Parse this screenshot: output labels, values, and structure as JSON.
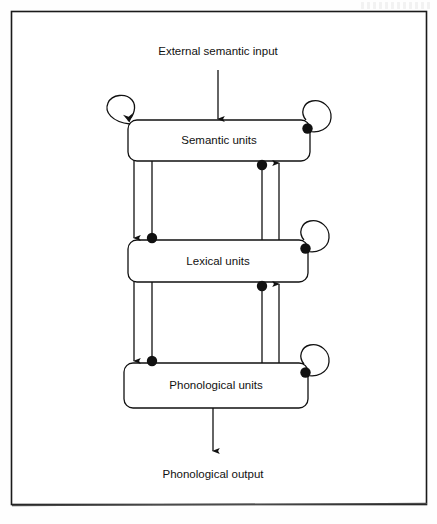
{
  "figure": {
    "frame": {
      "border_color": "#1a1a1a"
    },
    "input_label": "External semantic input",
    "output_label": "Phonological output",
    "layers": [
      {
        "id": "semantic",
        "label": "Semantic units"
      },
      {
        "id": "lexical",
        "label": "Lexical units"
      },
      {
        "id": "phonological",
        "label": "Phonological units"
      }
    ],
    "self_connections": [
      {
        "layer": "semantic",
        "side": "left",
        "type": "excitatory",
        "terminal": "arrow"
      },
      {
        "layer": "semantic",
        "side": "right",
        "type": "inhibitory",
        "terminal": "dot"
      },
      {
        "layer": "lexical",
        "side": "right",
        "type": "inhibitory",
        "terminal": "dot"
      },
      {
        "layer": "phonological",
        "side": "right",
        "type": "inhibitory",
        "terminal": "dot"
      }
    ],
    "inter_layer_connections": [
      {
        "from": "semantic",
        "to": "lexical",
        "direction": "down",
        "column": "left-outer",
        "type": "excitatory",
        "terminal": "arrow"
      },
      {
        "from": "semantic",
        "to": "lexical",
        "direction": "down",
        "column": "left-inner",
        "type": "inhibitory",
        "terminal": "dot"
      },
      {
        "from": "lexical",
        "to": "semantic",
        "direction": "up",
        "column": "right-inner",
        "type": "inhibitory",
        "terminal": "dot"
      },
      {
        "from": "lexical",
        "to": "semantic",
        "direction": "up",
        "column": "right-outer",
        "type": "excitatory",
        "terminal": "arrow"
      },
      {
        "from": "lexical",
        "to": "phonological",
        "direction": "down",
        "column": "left-outer",
        "type": "excitatory",
        "terminal": "arrow"
      },
      {
        "from": "lexical",
        "to": "phonological",
        "direction": "down",
        "column": "left-inner",
        "type": "inhibitory",
        "terminal": "dot"
      },
      {
        "from": "phonological",
        "to": "lexical",
        "direction": "up",
        "column": "right-inner",
        "type": "inhibitory",
        "terminal": "dot"
      },
      {
        "from": "phonological",
        "to": "lexical",
        "direction": "up",
        "column": "right-outer",
        "type": "excitatory",
        "terminal": "arrow"
      }
    ],
    "colors": {
      "stroke": "#111111",
      "fill": "none",
      "text": "#111111",
      "background": "#ffffff"
    }
  }
}
